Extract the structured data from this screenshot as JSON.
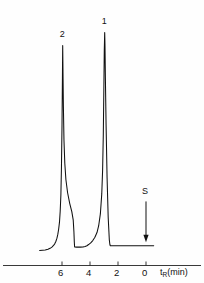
{
  "figure": {
    "name": "gas-chromatogram",
    "background_color": "#fefefe",
    "trace_color": "#101010",
    "axis_color": "#222222"
  },
  "axis": {
    "title": "t",
    "title_subscript": "R",
    "title_units": "(min)",
    "direction": "decreasing-right",
    "tick_labels": [
      "6",
      "4",
      "2",
      "0"
    ],
    "tick_values": [
      6,
      4,
      2,
      0
    ],
    "range_min": 0,
    "range_max": 7.6
  },
  "annotations": {
    "peaks": [
      {
        "label": "2",
        "retention_time": 5.95
      },
      {
        "label": "1",
        "retention_time": 2.95
      }
    ],
    "events": [
      {
        "label": "S",
        "retention_time": 0.0,
        "marker": "down-arrow"
      }
    ]
  },
  "chart_data": {
    "type": "line",
    "title": "",
    "subtitle": "",
    "xlabel": "tR(min)",
    "ylabel": "Detector response",
    "xlim": [
      7.6,
      -0.6
    ],
    "ylim": [
      0,
      1.0
    ],
    "grid": false,
    "legend": null,
    "x_axis_reversed": true,
    "series": [
      {
        "name": "detector-signal",
        "x": [
          7.6,
          7.4,
          7.2,
          7.0,
          6.85,
          6.72,
          6.62,
          6.52,
          6.44,
          6.36,
          6.3,
          6.24,
          6.18,
          6.13,
          6.08,
          6.04,
          6.0,
          5.97,
          5.95,
          5.93,
          5.9,
          5.86,
          5.8,
          5.72,
          5.6,
          5.45,
          5.3,
          5.2,
          5.15,
          5.12,
          5.1,
          4.95,
          4.7,
          4.5,
          4.35,
          4.22,
          4.1,
          3.95,
          3.8,
          3.65,
          3.5,
          3.38,
          3.26,
          3.16,
          3.1,
          3.05,
          3.01,
          2.98,
          2.95,
          2.93,
          2.9,
          2.85,
          2.78,
          2.7,
          2.62,
          2.58,
          2.55,
          2.4,
          2.1,
          1.7,
          1.2,
          0.7,
          0.2,
          -0.3,
          -0.55
        ],
        "y": [
          0.03,
          0.031,
          0.032,
          0.035,
          0.039,
          0.044,
          0.05,
          0.058,
          0.068,
          0.082,
          0.098,
          0.12,
          0.15,
          0.195,
          0.265,
          0.38,
          0.56,
          0.76,
          0.9,
          0.79,
          0.64,
          0.5,
          0.4,
          0.33,
          0.275,
          0.23,
          0.195,
          0.16,
          0.11,
          0.065,
          0.045,
          0.044,
          0.044,
          0.045,
          0.047,
          0.05,
          0.055,
          0.062,
          0.072,
          0.086,
          0.106,
          0.135,
          0.185,
          0.27,
          0.37,
          0.52,
          0.72,
          0.88,
          0.955,
          0.9,
          0.76,
          0.56,
          0.34,
          0.17,
          0.075,
          0.055,
          0.05,
          0.05,
          0.05,
          0.05,
          0.05,
          0.05,
          0.05,
          0.05,
          0.05
        ],
        "peak_labels": [
          {
            "label": "2",
            "x": 5.95,
            "y": 0.9
          },
          {
            "label": "1",
            "x": 2.95,
            "y": 0.955
          }
        ]
      }
    ],
    "annotations": [
      {
        "text": "S",
        "x": 0.0,
        "y": 0.255,
        "arrow": "down",
        "arrow_to_y": 0.065
      }
    ]
  }
}
